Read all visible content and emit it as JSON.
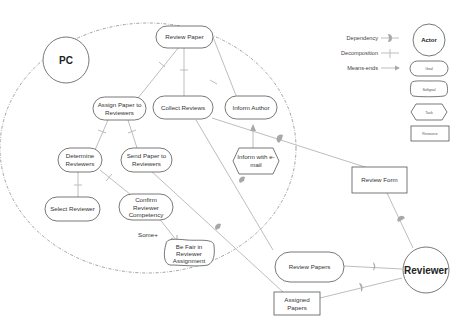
{
  "diagram": {
    "type": "i* strategic rationale model",
    "actors": [
      {
        "id": "pc",
        "label": "PC"
      },
      {
        "id": "reviewer",
        "label": "Reviewer"
      }
    ],
    "tasks_pc": [
      {
        "id": "review_paper",
        "label_lines": [
          "Review Paper"
        ]
      },
      {
        "id": "assign_paper",
        "label_lines": [
          "Assign Paper to",
          "Reviewers"
        ]
      },
      {
        "id": "collect_reviews",
        "label_lines": [
          "Collect Reviews"
        ]
      },
      {
        "id": "inform_author",
        "label_lines": [
          "Inform Author"
        ]
      },
      {
        "id": "determine_reviewers",
        "label_lines": [
          "Determine",
          "Reviewers"
        ]
      },
      {
        "id": "send_paper",
        "label_lines": [
          "Send Paper to",
          "Reviewers"
        ]
      },
      {
        "id": "select_reviewer",
        "label_lines": [
          "Select Reviewer"
        ]
      },
      {
        "id": "confirm_competency",
        "label_lines": [
          "Confirm",
          "Reviewer",
          "Competency"
        ]
      },
      {
        "id": "inform_email",
        "label_lines": [
          "Inform with e-",
          "mail"
        ]
      }
    ],
    "softgoals": [
      {
        "id": "be_fair",
        "label_lines": [
          "Be Fair in",
          "Reviewer",
          "Assignment"
        ]
      }
    ],
    "contribution_label": "Some+",
    "tasks_reviewer": [
      {
        "id": "review_papers",
        "label_lines": [
          "Review Papers"
        ]
      }
    ],
    "resources": [
      {
        "id": "review_form",
        "label_lines": [
          "Review Form"
        ]
      },
      {
        "id": "assigned_papers",
        "label_lines": [
          "Assigned",
          "Papers"
        ]
      }
    ]
  },
  "legend": {
    "links": [
      {
        "label": "Dependency"
      },
      {
        "label": "Decomposition"
      },
      {
        "label": "Means-ends"
      }
    ],
    "elements": [
      {
        "label": "Actor"
      },
      {
        "label": "Goal"
      },
      {
        "label": "Softgoal"
      },
      {
        "label": "Task"
      },
      {
        "label": "Resource"
      }
    ]
  },
  "colors": {
    "stroke": "#555555",
    "link": "#b5b5b5",
    "dependency_marker": "#a8a8a8",
    "boundary": "#8a8a8a",
    "background": "#ffffff"
  }
}
